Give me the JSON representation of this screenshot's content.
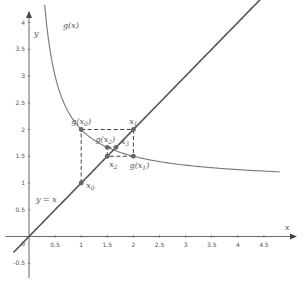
{
  "chart_data": {
    "type": "line",
    "title": "",
    "xlabel": "x",
    "ylabel": "y",
    "xlim": [
      -0.3,
      5.0
    ],
    "ylim": [
      -0.65,
      4.3
    ],
    "grid": false,
    "x_ticks": [
      0.5,
      1,
      1.5,
      2,
      2.5,
      3,
      3.5,
      4,
      4.5
    ],
    "x_tick_labels": [
      "0.5",
      "1",
      "1.5",
      "2",
      "2.5",
      "3",
      "3.5",
      "4",
      "4.5"
    ],
    "y_ticks": [
      -0.5,
      0.5,
      1,
      1.5,
      2,
      2.5,
      3,
      3.5,
      4
    ],
    "y_tick_labels": [
      "-0.5",
      "0.5",
      "1",
      "1.5",
      "2",
      "2.5",
      "3",
      "3.5",
      "4"
    ],
    "origin_label": "0",
    "series": [
      {
        "name": "g(x)",
        "label": "g(x)",
        "formula": "1 + 1/x",
        "x_range": [
          0.3,
          4.8
        ],
        "color": "#777777"
      },
      {
        "name": "y = x",
        "label": "y = x",
        "formula": "x",
        "x_range": [
          -0.3,
          5.0
        ],
        "color": "#555555"
      }
    ],
    "cobweb": {
      "path": [
        [
          1,
          1
        ],
        [
          1,
          2
        ],
        [
          2,
          2
        ],
        [
          2,
          1.5
        ],
        [
          1.5,
          1.5
        ],
        [
          1.5,
          1.6667
        ],
        [
          1.6667,
          1.6667
        ]
      ],
      "style": "dashed",
      "color": "#444444"
    },
    "points": [
      {
        "name": "x0",
        "x": 1,
        "y": 1,
        "label": "x",
        "sub": "0",
        "label_pos": "right"
      },
      {
        "name": "g(x0)",
        "x": 1,
        "y": 2,
        "label": "g(x",
        "sub": "0",
        "label_pos": "top"
      },
      {
        "name": "x1",
        "x": 2,
        "y": 2,
        "label": "x",
        "sub": "1",
        "label_pos": "top-left"
      },
      {
        "name": "g(x1)",
        "x": 2,
        "y": 1.5,
        "label": "g(x",
        "sub": "1",
        "label_pos": "bottom"
      },
      {
        "name": "x2",
        "x": 1.5,
        "y": 1.5,
        "label": "x",
        "sub": "2",
        "label_pos": "bottom"
      },
      {
        "name": "g(x2)",
        "x": 1.5,
        "y": 1.6667,
        "label": "g(x",
        "sub": "2",
        "label_pos": "top-left"
      },
      {
        "name": "x3",
        "x": 1.6667,
        "y": 1.6667,
        "label": "x",
        "sub": "3",
        "label_pos": "right"
      }
    ],
    "point_color": "#666666"
  }
}
